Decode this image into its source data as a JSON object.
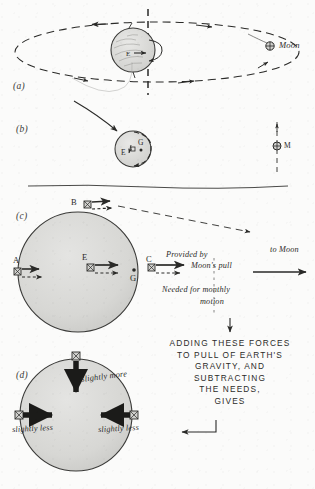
{
  "figure": {
    "panels": [
      {
        "id": "a",
        "label": "(a)"
      },
      {
        "id": "b",
        "label": "(b)"
      },
      {
        "id": "c",
        "label": "(c)"
      },
      {
        "id": "d",
        "label": "(d)"
      }
    ]
  },
  "panel_a": {
    "label": "(a)",
    "moon_label": "Moon",
    "earth_center_label": "E",
    "orbit_style": "dashed-ellipse",
    "axis_style": "dashed-vertical"
  },
  "panel_b": {
    "label": "(b)",
    "earth_label": "E",
    "barycenter_label": "G",
    "moon_label": "M"
  },
  "panel_c": {
    "label": "(c)",
    "points": [
      {
        "name": "A",
        "label": "A"
      },
      {
        "name": "B",
        "label": "B"
      },
      {
        "name": "C",
        "label": "C"
      },
      {
        "name": "E",
        "label": "E"
      },
      {
        "name": "G",
        "label": "G"
      }
    ],
    "annotation_provided": "Provided by",
    "annotation_provided_2": "Moon's pull",
    "annotation_needed": "Needed for monthly",
    "annotation_needed_2": "motion",
    "to_moon_label": "to Moon"
  },
  "panel_d": {
    "label": "(d)",
    "slightly_more": "slightly more",
    "slightly_less_left": "slightly less",
    "slightly_less_right": "slightly less"
  },
  "center_text": {
    "lines": [
      "ADDING THESE FORCES",
      "TO PULL OF EARTH'S",
      "GRAVITY, AND",
      "SUBTRACTING",
      "THE NEEDS,",
      "GIVES"
    ],
    "full": "ADDING THESE FORCES\nTO PULL OF EARTH'S\nGRAVITY, AND\nSUBTRACTING\nTHE NEEDS,\nGIVES"
  },
  "colors": {
    "ink": "#2a2a28",
    "paper": "#fbfbfa",
    "globe_fill": "#d9d9d7",
    "globe_stroke": "#4a4a48"
  }
}
